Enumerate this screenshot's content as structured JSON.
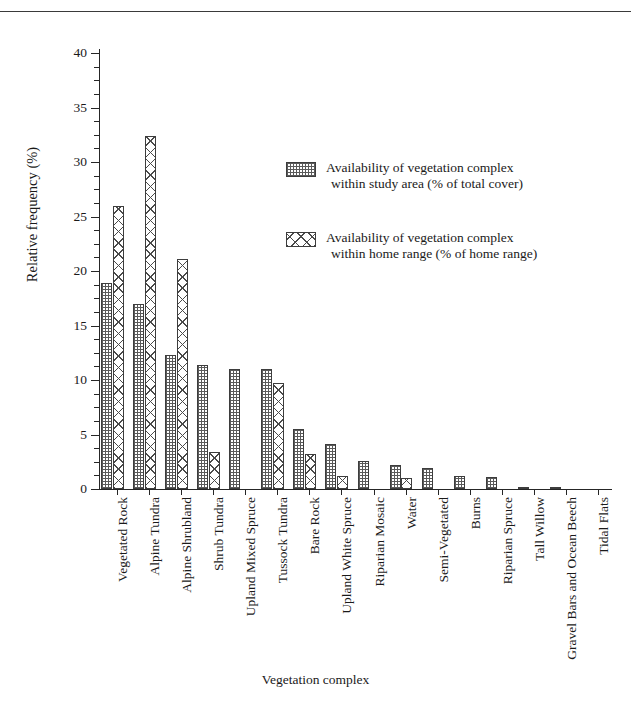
{
  "chart_data": {
    "type": "bar",
    "title": "",
    "xlabel": "Vegetation complex",
    "ylabel": "Relative frequency (%)",
    "ylim": [
      0,
      40
    ],
    "ytick_labels": [
      "0",
      "5",
      "10",
      "15",
      "20",
      "25",
      "30",
      "35",
      "40"
    ],
    "ytick_values": [
      0,
      5,
      10,
      15,
      20,
      25,
      30,
      35,
      40
    ],
    "yminor_step": 1.25,
    "grid": false,
    "legend_position": "upper-center-right",
    "categories": [
      "Vegetated Rock",
      "Alpine Tundra",
      "Alpine Shrubland",
      "Shrub Tundra",
      "Upland Mixed Spruce",
      "Tussock Tundra",
      "Bare Rock",
      "Upland White Spruce",
      "Riparian Mosaic",
      "Water",
      "Semi-Vegetated",
      "Burns",
      "Riparian Spruce",
      "Tall Willow",
      "Gravel Bars and Ocean Beech",
      "Tidal Flats"
    ],
    "series": [
      {
        "name": "Availability of vegetation complex within study area (% of total cover)",
        "pattern": "fine-checker",
        "values": [
          18.9,
          17.0,
          12.3,
          11.4,
          11.0,
          11.0,
          5.5,
          4.1,
          2.6,
          2.2,
          1.9,
          1.2,
          1.1,
          0.1,
          0.2,
          0.0
        ]
      },
      {
        "name": "Availability of vegetation complex within home range (% of home range)",
        "pattern": "coarse-cross-hatch",
        "values": [
          26.0,
          32.4,
          21.1,
          3.4,
          0.0,
          9.7,
          3.2,
          1.2,
          0.0,
          1.0,
          0.0,
          0.0,
          0.0,
          0.0,
          0.0,
          0.0
        ]
      }
    ]
  },
  "legend": {
    "entries": [
      {
        "line1": "Availability of vegetation complex",
        "line2": "within study area (% of total cover)"
      },
      {
        "line1": "Availability of vegetation complex",
        "line2": "within home range (% of home range)"
      }
    ]
  },
  "axes": {
    "y_title": "Relative frequency (%)",
    "x_title": "Vegetation complex"
  }
}
